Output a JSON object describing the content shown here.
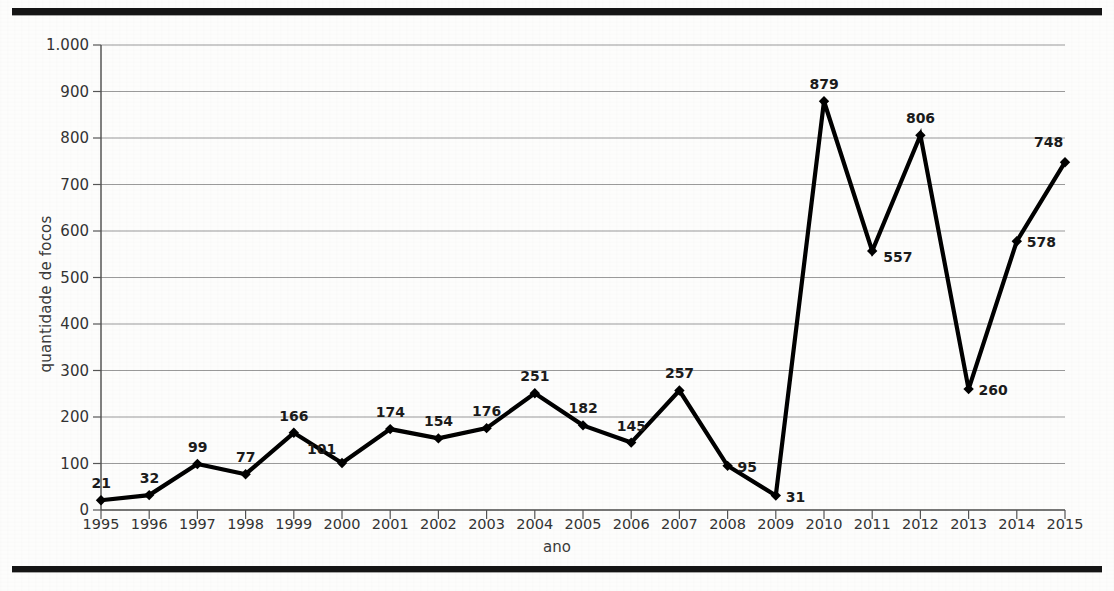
{
  "axis": {
    "ylabel": "quantidade de focos",
    "xlabel": "ano",
    "yticks": [
      "0",
      "100",
      "200",
      "300",
      "400",
      "500",
      "600",
      "700",
      "800",
      "900",
      "1.000"
    ]
  },
  "chart_data": {
    "type": "line",
    "title": "",
    "xlabel": "ano",
    "ylabel": "quantidade de focos",
    "categories": [
      "1995",
      "1996",
      "1997",
      "1998",
      "1999",
      "2000",
      "2001",
      "2002",
      "2003",
      "2004",
      "2005",
      "2006",
      "2007",
      "2008",
      "2009",
      "2010",
      "2011",
      "2012",
      "2013",
      "2014",
      "2015"
    ],
    "values": [
      21,
      32,
      99,
      77,
      166,
      101,
      174,
      154,
      176,
      251,
      182,
      145,
      257,
      95,
      31,
      879,
      557,
      806,
      260,
      578,
      748
    ],
    "data_labels": [
      "21",
      "32",
      "99",
      "77",
      "166",
      "101",
      "174",
      "154",
      "176",
      "251",
      "182",
      "145",
      "257",
      "95",
      "31",
      "879",
      "557",
      "806",
      "260",
      "578",
      "748"
    ],
    "label_positions": [
      "above",
      "above",
      "above",
      "above",
      "above",
      "above-left",
      "above",
      "above",
      "above",
      "above",
      "above",
      "above",
      "above",
      "right",
      "right",
      "above",
      "below-right",
      "above",
      "right",
      "right",
      "above-right"
    ],
    "ylim": [
      0,
      1000
    ],
    "ytick_step": 100,
    "grid": true,
    "legend": false,
    "series_color": "#000000",
    "grid_color": "#9a9a9a",
    "marker": "diamond"
  }
}
